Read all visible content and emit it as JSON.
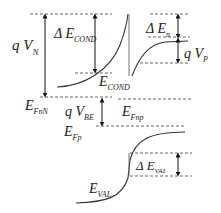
{
  "diagram": {
    "labels": {
      "qVN": {
        "main": "q V",
        "sub": "N"
      },
      "dEcond": {
        "main": "Δ E",
        "sub": "COND"
      },
      "dEn": {
        "main": "Δ E",
        "sub": "n"
      },
      "qVP": {
        "main": "q V",
        "sub": "P"
      },
      "Econd": {
        "main": "E",
        "sub": "COND"
      },
      "EFnN": {
        "main": "E",
        "sub": "FnN"
      },
      "qVBE": {
        "main": "q V",
        "sub": "BE"
      },
      "EFnp": {
        "main": "E",
        "sub": "Fnp"
      },
      "EFp": {
        "main": "E",
        "sub": "Fp"
      },
      "dEval": {
        "main": "Δ E",
        "sub": "VAL"
      },
      "Eval": {
        "main": "E",
        "sub": "VAL"
      }
    },
    "colors": {
      "line": "#333333",
      "dash": "#555555",
      "text": "#222222",
      "background": "#ffffff"
    }
  }
}
